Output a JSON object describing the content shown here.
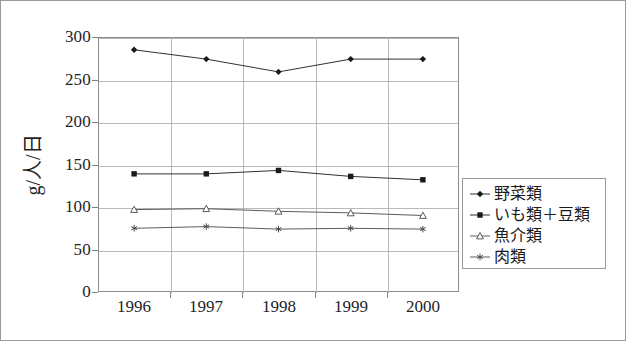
{
  "chart_data": {
    "type": "line",
    "title": "",
    "subtitle": "",
    "xlabel": "",
    "ylabel": "g/人/日",
    "categories": [
      "1996",
      "1997",
      "1998",
      "1999",
      "2000"
    ],
    "x": [
      1996,
      1997,
      1998,
      1999,
      2000
    ],
    "ylim": [
      0,
      300
    ],
    "yticks": [
      0,
      50,
      100,
      150,
      200,
      250,
      300
    ],
    "ytick_labels": [
      "0",
      "50",
      "100",
      "150",
      "200",
      "250",
      "300"
    ],
    "grid": true,
    "grid_axis": "both",
    "legend_position": "right-outside",
    "series": [
      {
        "name": "野菜類",
        "marker": "filled-diamond",
        "color": "#1a1a1a",
        "values": [
          285,
          274,
          259,
          274,
          274
        ]
      },
      {
        "name": "いも類＋豆類",
        "marker": "filled-square",
        "color": "#1a1a1a",
        "values": [
          139,
          139,
          143,
          136,
          132
        ]
      },
      {
        "name": "魚介類",
        "marker": "open-triangle",
        "color": "#4a4a4a",
        "values": [
          97,
          98,
          95,
          93,
          90
        ]
      },
      {
        "name": "肉類",
        "marker": "asterisk",
        "color": "#4a4a4a",
        "values": [
          75,
          77,
          74,
          75,
          74
        ]
      }
    ]
  },
  "axes": {
    "y_axis_title": "g/人/日",
    "y_tick_labels": [
      "300",
      "250",
      "200",
      "150",
      "100",
      "50",
      "0"
    ],
    "x_tick_labels": [
      "1996",
      "1997",
      "1998",
      "1999",
      "2000"
    ]
  },
  "legend": {
    "items": [
      {
        "label": "野菜類",
        "marker": "filled-diamond"
      },
      {
        "label": "いも類＋豆類",
        "marker": "filled-square"
      },
      {
        "label": "魚介類",
        "marker": "open-triangle"
      },
      {
        "label": "肉類",
        "marker": "asterisk"
      }
    ]
  },
  "colors": {
    "frame": "#8d8d8d",
    "grid": "#b9b9b9",
    "line": "#1a1a1a",
    "text": "#1f1f1f",
    "background": "#ffffff"
  }
}
